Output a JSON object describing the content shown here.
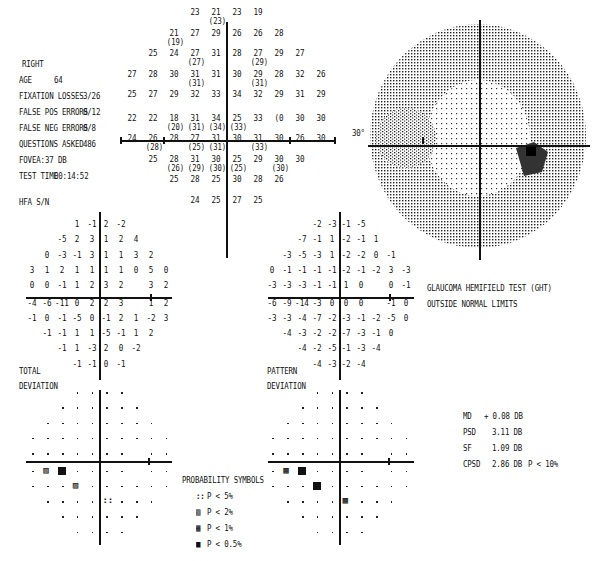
{
  "header": {
    "eye": "RIGHT",
    "age_label": "AGE",
    "age_value": "64",
    "fixation_losses_label": "FIXATION LOSSES",
    "fixation_losses_value": "3/26",
    "false_pos_label": "FALSE POS ERRORS",
    "false_pos_value": "0/12",
    "false_neg_label": "FALSE NEG ERRORS",
    "false_neg_value": "0/8",
    "questions_label": "QUESTIONS ASKED",
    "questions_value": "486",
    "fovea_label": "FOVEA:",
    "fovea_value": "37 DB",
    "test_time_label": "TEST TIME",
    "test_time_value": "00:14:52",
    "strategy": "HFA S/N"
  },
  "threshold_grid": {
    "rows": [
      [
        null,
        null,
        null,
        "23",
        "21|23",
        "23",
        "19",
        null,
        null,
        null
      ],
      [
        null,
        null,
        "21|19",
        "27",
        "29",
        "26",
        "26",
        "28",
        null,
        null
      ],
      [
        null,
        "25",
        "24",
        "27|27",
        "31",
        "28",
        "27|29",
        "29",
        "27",
        null
      ],
      [
        "27",
        "28",
        "30",
        "31|31",
        "31",
        "30",
        "29|31",
        "28",
        "32",
        "26"
      ],
      [
        "25",
        "27",
        "29",
        "32",
        "33",
        "34",
        "32",
        "29",
        "31",
        "29"
      ],
      [
        "22",
        "22",
        "18|20",
        "31|31",
        "34|34",
        "25|33",
        "33",
        "(0",
        "30",
        "30"
      ],
      [
        "24",
        "26|28",
        "28",
        "27|25",
        "31|31",
        "30",
        "31|33",
        "30",
        "26",
        "30"
      ],
      [
        null,
        "25",
        "28|26",
        "31|29",
        "30|30",
        "25|25",
        "29",
        "30|30",
        "30",
        null
      ],
      [
        null,
        null,
        "25",
        "28",
        "25",
        "30",
        "28",
        "26",
        null,
        null
      ],
      [
        null,
        null,
        null,
        "24",
        "25",
        "27",
        "25",
        null,
        null,
        null
      ]
    ]
  },
  "gray_map": {
    "degree_label": "30°"
  },
  "total_deviation": {
    "label_line1": "TOTAL",
    "label_line2": "DEVIATION",
    "rows": [
      [
        null,
        null,
        null,
        "1",
        "-1",
        "2",
        "-2",
        null,
        null,
        null
      ],
      [
        null,
        null,
        "-5",
        "2",
        "3",
        "1",
        "2",
        "4",
        null,
        null
      ],
      [
        null,
        "0",
        "-3",
        "-1",
        "3",
        "1",
        "1",
        "3",
        "2",
        null
      ],
      [
        "3",
        "1",
        "2",
        "1",
        "1",
        "1",
        "1",
        "0",
        "5",
        "0"
      ],
      [
        "0",
        "0",
        "-1",
        "1",
        "2",
        "3",
        "2",
        null,
        "3",
        "2"
      ],
      [
        "-4",
        "-6",
        "-11",
        "0",
        "2",
        "2",
        "3",
        null,
        "1",
        "2"
      ],
      [
        "-1",
        "0",
        "-1",
        "-5",
        "0",
        "-1",
        "2",
        "1",
        "-2",
        "3"
      ],
      [
        null,
        "-1",
        "-1",
        "1",
        "1",
        "-5",
        "-1",
        "1",
        "2",
        null
      ],
      [
        null,
        null,
        "-1",
        "1",
        "-3",
        "2",
        "0",
        "-2",
        null,
        null
      ],
      [
        null,
        null,
        null,
        "-1",
        "-1",
        "0",
        "-1",
        null,
        null,
        null
      ]
    ],
    "prob_symbols": [
      {
        "row": 5,
        "col": 1,
        "sym": "p2"
      },
      {
        "row": 5,
        "col": 2,
        "sym": "p05"
      },
      {
        "row": 6,
        "col": 3,
        "sym": "p2"
      },
      {
        "row": 7,
        "col": 5,
        "sym": "p5"
      }
    ]
  },
  "pattern_deviation": {
    "label_line1": "PATTERN",
    "label_line2": "DEVIATION",
    "rows": [
      [
        null,
        null,
        null,
        "-2",
        "-3",
        "-1",
        "-5",
        null,
        null,
        null
      ],
      [
        null,
        null,
        "-7",
        "-1",
        "1",
        "-2",
        "-1",
        "1",
        null,
        null
      ],
      [
        null,
        "-3",
        "-5",
        "-3",
        "1",
        "-2",
        "-2",
        "0",
        "-1",
        null
      ],
      [
        "0",
        "-1",
        "-1",
        "-1",
        "-1",
        "-2",
        "-1",
        "-2",
        "3",
        "-3"
      ],
      [
        "-3",
        "-3",
        "-3",
        "-1",
        "-1",
        "1",
        "0",
        null,
        "0",
        "-1"
      ],
      [
        "-6",
        "-9",
        "-14",
        "-3",
        "0",
        "0",
        "0",
        null,
        "-1",
        "0"
      ],
      [
        "-3",
        "-3",
        "-4",
        "-7",
        "-2",
        "-3",
        "-1",
        "-2",
        "-5",
        "0"
      ],
      [
        null,
        "-4",
        "-3",
        "-2",
        "-2",
        "-7",
        "-3",
        "-1",
        "0",
        null
      ],
      [
        null,
        null,
        "-4",
        "-2",
        "-5",
        "-1",
        "-3",
        "-4",
        null,
        null
      ],
      [
        null,
        null,
        null,
        "-4",
        "-3",
        "-2",
        "-4",
        null,
        null,
        null
      ]
    ],
    "prob_symbols": [
      {
        "row": 5,
        "col": 1,
        "sym": "p1"
      },
      {
        "row": 5,
        "col": 2,
        "sym": "p05"
      },
      {
        "row": 6,
        "col": 3,
        "sym": "p05"
      },
      {
        "row": 7,
        "col": 5,
        "sym": "p1"
      }
    ]
  },
  "ght": {
    "line1": "GLAUCOMA HEMIFIELD TEST (GHT)",
    "line2": "OUTSIDE NORMAL LIMITS"
  },
  "legend": {
    "title": "PROBABILITY SYMBOLS",
    "items": [
      {
        "glyph": "::",
        "text": "P <  5%"
      },
      {
        "glyph": "▨",
        "text": "P <  2%"
      },
      {
        "glyph": "▩",
        "text": "P <  1%"
      },
      {
        "glyph": "■",
        "text": "P < 0.5%"
      }
    ]
  },
  "global_indices": [
    {
      "label": "MD",
      "value": "+ 0.08 DB",
      "p": ""
    },
    {
      "label": "PSD",
      "value": "3.11 DB",
      "p": ""
    },
    {
      "label": "SF",
      "value": "1.09 DB",
      "p": ""
    },
    {
      "label": "CPSD",
      "value": "2.86 DB",
      "p": "P <  10%"
    }
  ]
}
